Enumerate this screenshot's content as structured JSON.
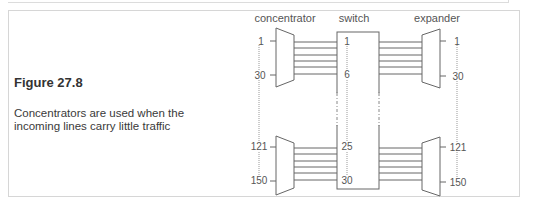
{
  "figure": {
    "title": "Figure 27.8",
    "caption": "Concentrators are used when the incoming lines carry little traffic"
  },
  "diagram": {
    "headers": {
      "concentrator": "concentrator",
      "switch": "switch",
      "expander": "expander"
    },
    "concentrator_labels": {
      "top_first": "1",
      "top_last": "30",
      "bottom_first": "121",
      "bottom_last": "150"
    },
    "switch_labels": {
      "top_first": "1",
      "top_last": "6",
      "bottom_first": "25",
      "bottom_last": "30"
    },
    "expander_labels": {
      "top_first": "1",
      "top_last": "30",
      "bottom_first": "121",
      "bottom_last": "150"
    },
    "lines_per_group": 6,
    "colors": {
      "stroke": "#666666",
      "text": "#555555",
      "border": "#d6d6d6"
    }
  }
}
